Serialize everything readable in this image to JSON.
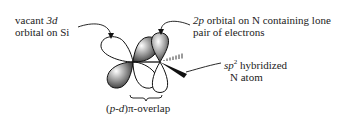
{
  "labels": {
    "si_orbital": {
      "line1_prefix": "vacant ",
      "line1_italic": "3d",
      "line2": "orbital on Si"
    },
    "n_orbital": {
      "line1_italic": "2p",
      "line1_rest": " orbital on N containing lone",
      "line2": "pair of electrons"
    },
    "n_atom": {
      "line1_italic": "sp",
      "line1_sup": "2",
      "line1_rest": " hybridized",
      "line2": "N atom"
    },
    "overlap": {
      "prefix": "(",
      "italic": "p-d",
      "suffix": ")π-overlap"
    }
  }
}
